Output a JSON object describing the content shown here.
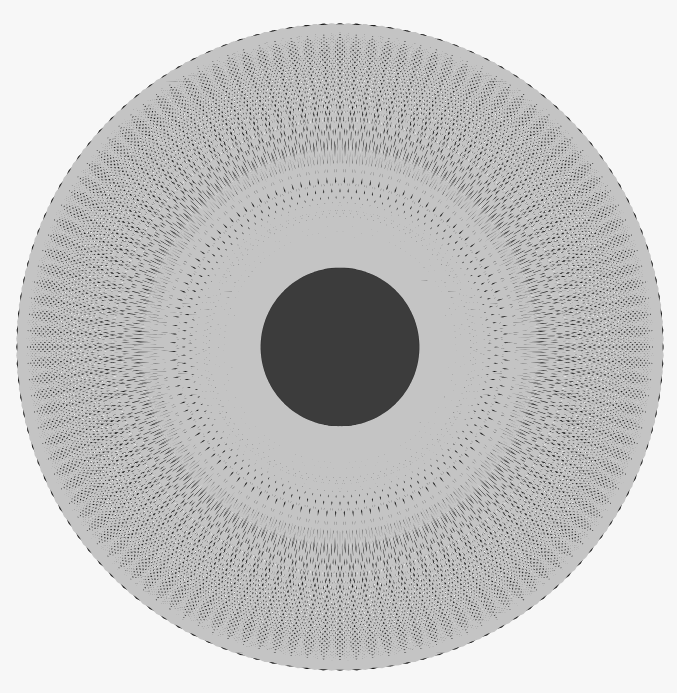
{
  "image": {
    "description": "Spirograph pattern: two interleaved hypotrochoid curve sets (black and light gray) around a dark scalloped ring and a dark central disk on an off-white background",
    "width": 677,
    "height": 693,
    "background": "#f7f7f7"
  },
  "figure": {
    "center": {
      "x": 340,
      "y": 347
    },
    "outer_radius": 323,
    "center_disk": {
      "radius": 79,
      "color": "#3c3c3c"
    },
    "dark_ring": {
      "inner_radius": 79,
      "outer_radius": 160,
      "lobes": 24,
      "lobe_depth": 10,
      "color": "#2e2e2e"
    },
    "spirographs": [
      {
        "name": "black-curves",
        "color": "#1e1e1e",
        "stroke_width": 1.6,
        "R": 240,
        "r": 38.5,
        "d": 121.5,
        "rotation_deg": 0,
        "turns": 77
      },
      {
        "name": "gray-curves",
        "color": "#c4c4c4",
        "stroke_width": 1.8,
        "R": 240,
        "r": 38.5,
        "d": 121.5,
        "rotation_deg": 4.5,
        "turns": 77
      }
    ]
  }
}
